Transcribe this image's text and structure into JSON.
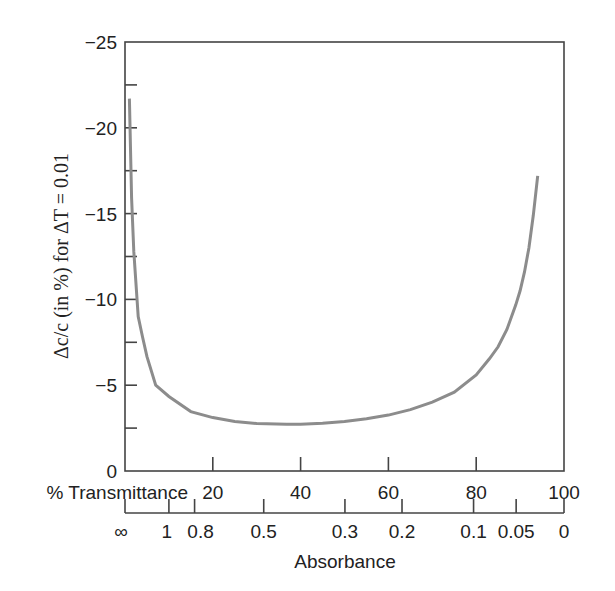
{
  "chart_data": {
    "type": "line",
    "title": "",
    "ylabel": "Δc/c (in %) for ΔT = 0.01",
    "xlabel_top": "% Transmittance",
    "xlabel_bottom": "Absorbance",
    "ylim": [
      0,
      -25
    ],
    "xlim": [
      0,
      100
    ],
    "grid": false,
    "y_ticks": [
      0,
      -5,
      -10,
      -15,
      -20,
      -25
    ],
    "y_tick_labels": [
      "0",
      "−5",
      "−10",
      "−15",
      "−20",
      "−25"
    ],
    "y_minor_ticks": [
      -2.5,
      -7.5,
      -12.5,
      -17.5,
      -22.5
    ],
    "x_ticks": [
      20,
      40,
      60,
      80,
      100
    ],
    "x_tick_labels": [
      "20",
      "40",
      "60",
      "80",
      "100"
    ],
    "absorbance_ticks": [
      {
        "label": "∞",
        "T": 0
      },
      {
        "label": "1",
        "T": 10
      },
      {
        "label": "0.8",
        "T": 15.85
      },
      {
        "label": "0.5",
        "T": 31.6
      },
      {
        "label": "0.3",
        "T": 50.1
      },
      {
        "label": "0.2",
        "T": 63.1
      },
      {
        "label": "0.1",
        "T": 79.4
      },
      {
        "label": "0.05",
        "T": 89.1
      },
      {
        "label": "0",
        "T": 100
      }
    ],
    "series": [
      {
        "name": "relative concentration error",
        "x": [
          1,
          1.5,
          2,
          3,
          4,
          5,
          7,
          10,
          15,
          20,
          25,
          30,
          36.8,
          40,
          45,
          50,
          55,
          60,
          65,
          70,
          75,
          80,
          83,
          85,
          87,
          89,
          90,
          91,
          92,
          93,
          94
        ],
        "values": [
          -21.7,
          -15.9,
          -12.8,
          -9.0,
          -7.8,
          -6.68,
          -5.0,
          -4.34,
          -3.46,
          -3.11,
          -2.88,
          -2.77,
          -2.72,
          -2.73,
          -2.78,
          -2.89,
          -3.05,
          -3.26,
          -3.58,
          -4.01,
          -4.6,
          -5.6,
          -6.54,
          -7.24,
          -8.25,
          -9.67,
          -10.5,
          -11.6,
          -13.0,
          -14.9,
          -17.2
        ]
      }
    ],
    "colors": {
      "curve": "#8c8c8c",
      "axis": "#444444"
    }
  }
}
